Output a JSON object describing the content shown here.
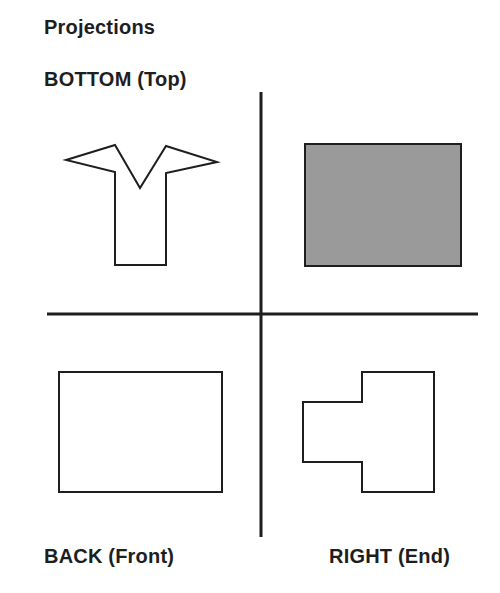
{
  "title": "Projections",
  "views": {
    "bottom": {
      "label": "BOTTOM (Top)",
      "shape": "y-shaped-outline"
    },
    "top_right": {
      "label": "",
      "shape": "shaded-rectangle",
      "fill": "#9a9a9a"
    },
    "back": {
      "label": "BACK (Front)",
      "shape": "rectangle-outline"
    },
    "right": {
      "label": "RIGHT (End)",
      "shape": "stepped-outline"
    }
  },
  "colors": {
    "line": "#1e1e1e",
    "shaded_fill": "#9a9a9a",
    "background": "#ffffff"
  }
}
